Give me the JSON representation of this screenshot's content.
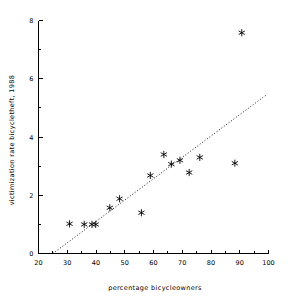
{
  "chart_data": {
    "type": "scatter",
    "title": "",
    "xlabel": "percentage bicycleowners",
    "ylabel": "victimization rate bicycletheft, 1988",
    "xlim": [
      20,
      100
    ],
    "ylim": [
      0,
      8
    ],
    "xticks": [
      20,
      30,
      40,
      50,
      60,
      70,
      80,
      90,
      100
    ],
    "xtick_labels": [
      "20",
      "30",
      "40",
      "50",
      "60",
      "70",
      "80",
      "90",
      "100"
    ],
    "yticks": [
      0,
      2,
      4,
      6,
      8
    ],
    "ytick_labels": [
      "0",
      "2",
      "4",
      "6",
      "8"
    ],
    "x_minor_ticks": [
      25,
      35,
      45,
      55,
      65,
      75,
      85,
      95
    ],
    "y_minor_ticks": [
      1,
      3,
      5,
      7
    ],
    "grid": false,
    "legend": false,
    "marker_style": "asterisk",
    "points": [
      {
        "x": 30.8,
        "y": 1.02
      },
      {
        "x": 35.9,
        "y": 1.0
      },
      {
        "x": 38.6,
        "y": 1.0
      },
      {
        "x": 39.9,
        "y": 1.0
      },
      {
        "x": 44.8,
        "y": 1.57
      },
      {
        "x": 48.2,
        "y": 1.88
      },
      {
        "x": 55.8,
        "y": 1.4
      },
      {
        "x": 58.9,
        "y": 2.68
      },
      {
        "x": 63.6,
        "y": 3.4
      },
      {
        "x": 66.2,
        "y": 3.07
      },
      {
        "x": 69.2,
        "y": 3.2
      },
      {
        "x": 72.4,
        "y": 2.78
      },
      {
        "x": 76.1,
        "y": 3.3
      },
      {
        "x": 88.3,
        "y": 3.1
      },
      {
        "x": 90.7,
        "y": 7.58
      }
    ],
    "fit_line": {
      "style": "dotted",
      "x_start": 25.0,
      "y_start": 0.0,
      "x_end": 99.3,
      "y_end": 5.45
    }
  },
  "axes": {
    "xlabel_text": "percentage bicycleowners",
    "ylabel_text": "victimization rate bicycletheft, 1988"
  }
}
